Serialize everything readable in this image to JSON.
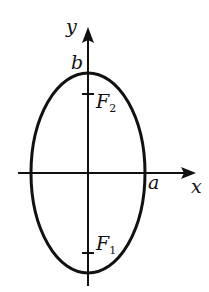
{
  "diagram": {
    "type": "ellipse-with-foci",
    "axes": {
      "x_label": "x",
      "y_label": "y"
    },
    "intercept_labels": {
      "x_intercept": "a",
      "y_intercept": "b"
    },
    "foci": [
      {
        "name": "F",
        "subscript": "2",
        "position": "upper"
      },
      {
        "name": "F",
        "subscript": "1",
        "position": "lower"
      }
    ],
    "colors": {
      "stroke": "#111111",
      "background": "#ffffff"
    }
  }
}
